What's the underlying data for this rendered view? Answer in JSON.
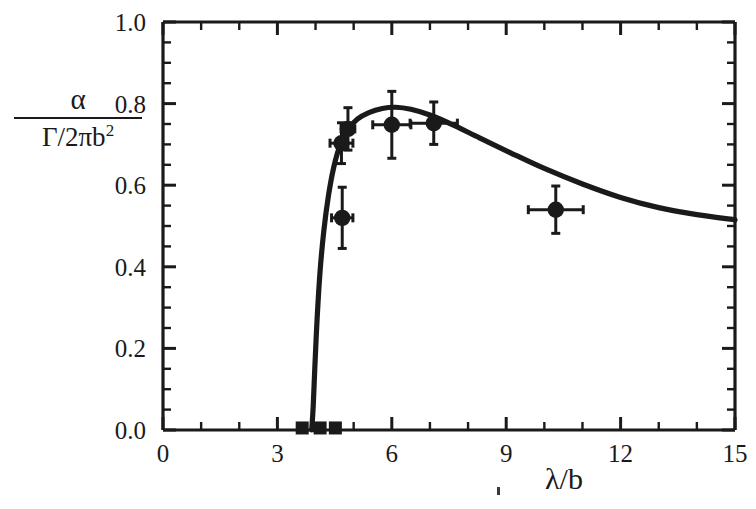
{
  "chart_data": {
    "type": "scatter",
    "title": "",
    "xlabel": "λ/b",
    "ylabel": "α / Γ/2πb²",
    "ylabel_numerator": "α",
    "ylabel_denominator": "Γ/2πb",
    "ylabel_denominator_exponent": "2",
    "xlim": [
      0,
      15
    ],
    "ylim": [
      0.0,
      1.0
    ],
    "xticks": [
      0,
      3,
      6,
      9,
      12,
      15
    ],
    "xtick_labels": [
      "0",
      "3",
      "6",
      "9",
      "12",
      "15"
    ],
    "yticks": [
      0.0,
      0.2,
      0.4,
      0.6,
      0.8,
      1.0
    ],
    "ytick_labels": [
      "0.0",
      "0.2",
      "0.4",
      "0.6",
      "0.8",
      "1.0"
    ],
    "x_minor_step": 1,
    "y_minor_step": 0.05,
    "grid": false,
    "legend": null,
    "series": [
      {
        "name": "measured points",
        "marker": "filled-circle",
        "color": "#1a1a1a",
        "points": [
          {
            "x": 4.7,
            "y": 0.52,
            "xerr": 0.28,
            "yerr": 0.075
          },
          {
            "x": 4.68,
            "y": 0.703,
            "xerr": 0.3,
            "yerr": 0.05
          },
          {
            "x": 4.85,
            "y": 0.738,
            "xerr": 0.18,
            "yerr": 0.052
          },
          {
            "x": 6.0,
            "y": 0.748,
            "xerr": 0.5,
            "yerr": 0.082
          },
          {
            "x": 7.1,
            "y": 0.752,
            "xerr": 0.62,
            "yerr": 0.052
          },
          {
            "x": 10.3,
            "y": 0.54,
            "xerr": 0.72,
            "yerr": 0.058
          }
        ]
      },
      {
        "name": "baseline squares",
        "marker": "filled-square",
        "color": "#1a1a1a",
        "points": [
          {
            "x": 3.65,
            "y": 0.005
          },
          {
            "x": 4.12,
            "y": 0.005
          },
          {
            "x": 4.52,
            "y": 0.005
          }
        ]
      },
      {
        "name": "theory curve",
        "marker": "line",
        "color": "#1a1a1a",
        "points": [
          {
            "x": 3.9,
            "y": 0.0
          },
          {
            "x": 3.94,
            "y": 0.06
          },
          {
            "x": 3.98,
            "y": 0.15
          },
          {
            "x": 4.04,
            "y": 0.27
          },
          {
            "x": 4.12,
            "y": 0.39
          },
          {
            "x": 4.22,
            "y": 0.49
          },
          {
            "x": 4.34,
            "y": 0.575
          },
          {
            "x": 4.48,
            "y": 0.645
          },
          {
            "x": 4.64,
            "y": 0.697
          },
          {
            "x": 4.84,
            "y": 0.735
          },
          {
            "x": 5.1,
            "y": 0.762
          },
          {
            "x": 5.4,
            "y": 0.778
          },
          {
            "x": 5.75,
            "y": 0.788
          },
          {
            "x": 6.1,
            "y": 0.791
          },
          {
            "x": 6.5,
            "y": 0.786
          },
          {
            "x": 7.0,
            "y": 0.772
          },
          {
            "x": 7.6,
            "y": 0.748
          },
          {
            "x": 8.3,
            "y": 0.716
          },
          {
            "x": 9.1,
            "y": 0.68
          },
          {
            "x": 10.0,
            "y": 0.641
          },
          {
            "x": 11.0,
            "y": 0.603
          },
          {
            "x": 12.0,
            "y": 0.57
          },
          {
            "x": 13.0,
            "y": 0.545
          },
          {
            "x": 14.0,
            "y": 0.528
          },
          {
            "x": 15.0,
            "y": 0.515
          }
        ]
      }
    ]
  }
}
